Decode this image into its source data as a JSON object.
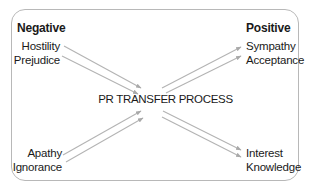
{
  "diagram": {
    "title": "PR TRANSFER PROCESS",
    "negative": {
      "heading": "Negative",
      "top_items": [
        "Hostility",
        "Prejudice"
      ],
      "bottom_items": [
        "Apathy",
        "Ignorance"
      ]
    },
    "positive": {
      "heading": "Positive",
      "top_items": [
        "Sympathy",
        "Acceptance"
      ],
      "bottom_items": [
        "Interest",
        "Knowledge"
      ]
    },
    "edges": [
      {
        "from": "Hostility",
        "to": "Sympathy"
      },
      {
        "from": "Prejudice",
        "to": "Acceptance"
      },
      {
        "from": "Apathy",
        "to": "Interest"
      },
      {
        "from": "Ignorance",
        "to": "Knowledge"
      }
    ],
    "colors": {
      "border": "#b8b8b8",
      "arrow": "#a9a9a9",
      "text": "#1a1a1a"
    }
  }
}
